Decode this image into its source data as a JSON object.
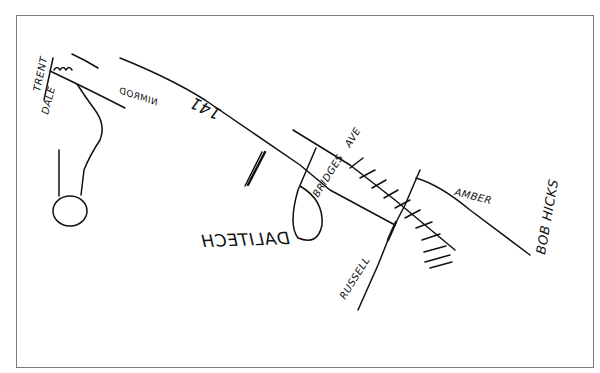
{
  "map": {
    "title": "Hand-drawn direction map",
    "colors": {
      "ink": "#111111",
      "frame": "#7a7a7a",
      "background": "#ffffff"
    },
    "labels": {
      "trent": "TRENT",
      "dale": "DALE",
      "nimrod": "NIMROD",
      "road_141": "141",
      "dalitech": "DALITECH",
      "bridges": "BRIDGES",
      "ave": "AVE",
      "russell": "RUSSELL",
      "amber": "AMBER",
      "bob_hicks": "BOB HICKS"
    }
  }
}
